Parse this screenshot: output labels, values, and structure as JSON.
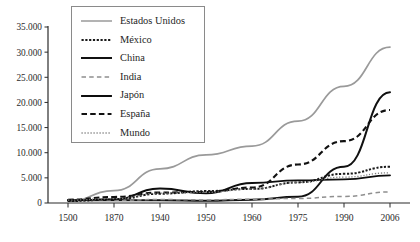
{
  "chart_data": {
    "type": "line",
    "title": "",
    "subtitle": "",
    "xlabel": "",
    "ylabel": "",
    "categories": [
      "1500",
      "1870",
      "1940",
      "1950",
      "1960",
      "1975",
      "1990",
      "2006"
    ],
    "ylim": [
      0,
      35000
    ],
    "yticks": [
      0,
      5000,
      10000,
      15000,
      20000,
      25000,
      30000,
      35000
    ],
    "ytick_labels": [
      "0",
      "5.000",
      "10.000",
      "15.000",
      "20.000",
      "25.000",
      "30.000",
      "35.000"
    ],
    "grid": false,
    "legend_position": "top-left-inside",
    "series": [
      {
        "name": "Estados Unidos",
        "style": "solid-light",
        "color": "#9a9a9a",
        "width": 1.7,
        "values": [
          300,
          2445,
          6800,
          9561,
          11328,
          16284,
          23200,
          31000
        ]
      },
      {
        "name": "México",
        "style": "dotted-thick",
        "color": "#1a1a1a",
        "width": 2.0,
        "values": [
          400,
          674,
          1852,
          2365,
          2800,
          4100,
          5800,
          7200
        ]
      },
      {
        "name": "China",
        "style": "solid-dark",
        "color": "#111111",
        "width": 2.0,
        "values": [
          600,
          530,
          560,
          448,
          662,
          1250,
          7200,
          22000
        ]
      },
      {
        "name": "India",
        "style": "dashed-light",
        "color": "#8f8f8f",
        "width": 1.5,
        "values": [
          550,
          533,
          686,
          619,
          753,
          900,
          1309,
          2200
        ]
      },
      {
        "name": "Japón",
        "style": "solid-dark2",
        "color": "#0d0d0d",
        "width": 1.9,
        "values": [
          500,
          737,
          2874,
          1921,
          3986,
          4500,
          4700,
          5500
        ]
      },
      {
        "name": "España",
        "style": "dashed-thick",
        "color": "#111111",
        "width": 2.1,
        "values": [
          661,
          1207,
          2080,
          2189,
          3072,
          7661,
          12300,
          18500
        ]
      },
      {
        "name": "Mundo",
        "style": "dotted-fine",
        "color": "#7d7d7d",
        "width": 1.3,
        "values": [
          566,
          867,
          1958,
          2111,
          2763,
          4089,
          5150,
          6000
        ]
      }
    ]
  },
  "legend": {
    "items": [
      {
        "label": "Estados Unidos",
        "swatch": "solid-light"
      },
      {
        "label": "México",
        "swatch": "dotted-thick"
      },
      {
        "label": "China",
        "swatch": "solid-dark"
      },
      {
        "label": "India",
        "swatch": "dashed-light"
      },
      {
        "label": "Japón",
        "swatch": "solid-dark2"
      },
      {
        "label": "España",
        "swatch": "dashed-thick"
      },
      {
        "label": "Mundo",
        "swatch": "dotted-fine"
      }
    ]
  }
}
